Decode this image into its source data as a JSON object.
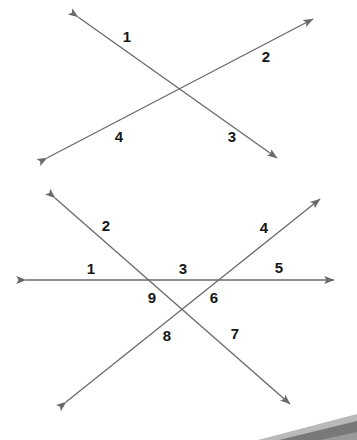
{
  "figure": {
    "name": "intersecting-lines-angle-diagram",
    "background_color": "#ffffff",
    "line_color": "#6a6a6a",
    "label_color": "#161616",
    "artifact_color": "#8d8d8d",
    "artifact_color_dark": "#5b5b5b"
  },
  "diagrams": [
    {
      "id": "top-diagram",
      "title": "two-intersecting-lines",
      "intersections": 1,
      "lines": [
        {
          "name": "line-falling",
          "x1": 78,
          "y1": 17,
          "x2": 277,
          "y2": 158,
          "arrow_start": true,
          "arrow_end": true
        },
        {
          "name": "line-rising",
          "x1": 47,
          "y1": 158,
          "x2": 313,
          "y2": 19,
          "arrow_start": true,
          "arrow_end": true
        }
      ],
      "labels": [
        {
          "text": "1",
          "x": 127,
          "y": 36
        },
        {
          "text": "2",
          "x": 266,
          "y": 56
        },
        {
          "text": "3",
          "x": 232,
          "y": 136
        },
        {
          "text": "4",
          "x": 119,
          "y": 136
        }
      ]
    },
    {
      "id": "bottom-diagram",
      "title": "three-intersecting-lines",
      "intersections": 3,
      "lines": [
        {
          "name": "line-horizontal",
          "x1": 26,
          "y1": 280,
          "x2": 334,
          "y2": 280,
          "arrow_start": true,
          "arrow_end": true
        },
        {
          "name": "line-falling-diagonal",
          "x1": 55,
          "y1": 198,
          "x2": 290,
          "y2": 404,
          "arrow_start": true,
          "arrow_end": true
        },
        {
          "name": "line-rising-diagonal",
          "x1": 66,
          "y1": 402,
          "x2": 320,
          "y2": 199,
          "arrow_start": true,
          "arrow_end": true
        }
      ],
      "labels": [
        {
          "text": "1",
          "x": 91,
          "y": 268
        },
        {
          "text": "2",
          "x": 106,
          "y": 225
        },
        {
          "text": "3",
          "x": 183,
          "y": 268
        },
        {
          "text": "4",
          "x": 264,
          "y": 227
        },
        {
          "text": "5",
          "x": 279,
          "y": 267
        },
        {
          "text": "6",
          "x": 214,
          "y": 297
        },
        {
          "text": "7",
          "x": 235,
          "y": 333
        },
        {
          "text": "8",
          "x": 167,
          "y": 335
        },
        {
          "text": "9",
          "x": 152,
          "y": 297
        }
      ]
    }
  ],
  "artifact": {
    "name": "scan-edge-artifact",
    "description": "gray angled band at bottom-right corner"
  }
}
